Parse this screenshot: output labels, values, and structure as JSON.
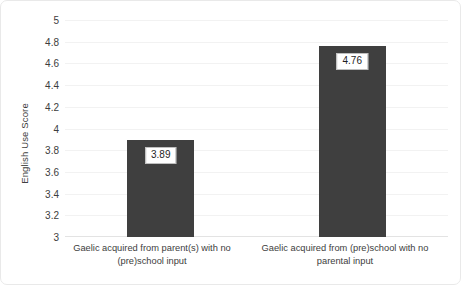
{
  "chart_data": {
    "type": "bar",
    "title": "",
    "xlabel": "",
    "ylabel": "English Use Score",
    "categories": [
      "Gaelic acquired from parent(s) with no (pre)school input",
      "Gaelic acquired from (pre)school with no parental input"
    ],
    "values": [
      3.89,
      4.76
    ],
    "value_labels": [
      "3.89",
      "4.76"
    ],
    "ylim": [
      3,
      5
    ],
    "ytick_step": 0.2,
    "ytick_labels": [
      "3",
      "3.2",
      "3.4",
      "3.6",
      "3.8",
      "4",
      "4.2",
      "4.4",
      "4.6",
      "4.8",
      "5"
    ],
    "ytick_values": [
      3,
      3.2,
      3.4,
      3.6,
      3.8,
      4,
      4.2,
      4.4,
      4.6,
      4.8,
      5
    ],
    "grid": true,
    "grid_axis": "y",
    "legend": false,
    "bar_color": "#3f3f3f",
    "gridline_color": "#f2f2f2",
    "axis_color": "#e3e3e3",
    "background": "#ffffff",
    "label_box_background": "#ffffff",
    "label_box_border": "#bfbfbf",
    "text_color": "#3d3d3d"
  }
}
